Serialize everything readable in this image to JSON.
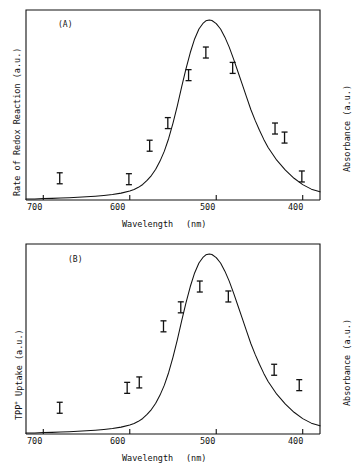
{
  "figure": {
    "background": "#ffffff",
    "line_color": "#111111",
    "panels": [
      {
        "id": "A",
        "label": "(A)",
        "y_left_title": "Rate of Redox Reaction  (a.u.)",
        "y_right_title": "Absorbance  (a.u.)",
        "x_title": "Wavelength",
        "x_units": "(nm)"
      },
      {
        "id": "B",
        "label": "(B)",
        "y_left_title_pre": "TPP",
        "y_left_title_sup": "+",
        "y_left_title_post": " Uptake  (a.u.)",
        "y_right_title": "Absorbance  (a.u.)",
        "x_title": "Wavelength",
        "x_units": "(nm)"
      }
    ],
    "x_ticks": [
      "700",
      "600",
      "500",
      "400"
    ]
  },
  "chart_data": [
    {
      "type": "line",
      "title": "(A)",
      "xlabel": "Wavelength (nm)",
      "ylabel": "Rate of Redox Reaction (a.u.)",
      "y2label": "Absorbance (a.u.)",
      "xlim": [
        720,
        380
      ],
      "ylim": [
        0,
        1.05
      ],
      "x_reversed": true,
      "grid": false,
      "legend": "none",
      "xticks": [
        700,
        600,
        500,
        400
      ],
      "series": [
        {
          "name": "Absorbance spectrum",
          "kind": "line",
          "x": [
            720,
            710,
            700,
            690,
            680,
            670,
            660,
            650,
            640,
            630,
            620,
            610,
            600,
            595,
            590,
            585,
            580,
            575,
            570,
            565,
            560,
            555,
            550,
            545,
            540,
            535,
            530,
            525,
            520,
            515,
            512,
            508,
            505,
            500,
            495,
            490,
            485,
            480,
            475,
            470,
            465,
            460,
            455,
            450,
            445,
            440,
            430,
            420,
            410,
            400,
            390,
            380
          ],
          "y": [
            0.005,
            0.006,
            0.008,
            0.009,
            0.011,
            0.013,
            0.015,
            0.018,
            0.021,
            0.025,
            0.03,
            0.038,
            0.05,
            0.058,
            0.07,
            0.086,
            0.108,
            0.135,
            0.17,
            0.215,
            0.27,
            0.34,
            0.425,
            0.52,
            0.625,
            0.725,
            0.815,
            0.89,
            0.945,
            0.978,
            0.99,
            0.995,
            0.992,
            0.975,
            0.945,
            0.9,
            0.845,
            0.78,
            0.71,
            0.64,
            0.57,
            0.5,
            0.44,
            0.385,
            0.335,
            0.29,
            0.22,
            0.165,
            0.12,
            0.085,
            0.06,
            0.045
          ]
        },
        {
          "name": "Rate of redox reaction data points",
          "kind": "ibar",
          "points": [
            {
              "x": 681,
              "y": 0.12
            },
            {
              "x": 601,
              "y": 0.115
            },
            {
              "x": 577,
              "y": 0.3
            },
            {
              "x": 556,
              "y": 0.425
            },
            {
              "x": 532,
              "y": 0.69
            },
            {
              "x": 512,
              "y": 0.815
            },
            {
              "x": 481,
              "y": 0.73
            },
            {
              "x": 432,
              "y": 0.395
            },
            {
              "x": 421,
              "y": 0.345
            },
            {
              "x": 401,
              "y": 0.13
            }
          ]
        }
      ]
    },
    {
      "type": "line",
      "title": "(B)",
      "xlabel": "Wavelength (nm)",
      "ylabel": "TPP+ Uptake (a.u.)",
      "y2label": "Absorbance (a.u.)",
      "xlim": [
        720,
        380
      ],
      "ylim": [
        0,
        1.05
      ],
      "x_reversed": true,
      "grid": false,
      "legend": "none",
      "xticks": [
        700,
        600,
        500,
        400
      ],
      "series": [
        {
          "name": "Absorbance spectrum",
          "kind": "line",
          "x": [
            720,
            710,
            700,
            690,
            680,
            670,
            660,
            650,
            640,
            630,
            620,
            610,
            600,
            595,
            590,
            585,
            580,
            575,
            570,
            565,
            560,
            555,
            550,
            545,
            540,
            535,
            530,
            525,
            520,
            515,
            512,
            508,
            505,
            500,
            495,
            490,
            485,
            480,
            475,
            470,
            465,
            460,
            455,
            450,
            445,
            440,
            430,
            420,
            410,
            400,
            390,
            380
          ],
          "y": [
            0.005,
            0.006,
            0.008,
            0.009,
            0.011,
            0.013,
            0.015,
            0.018,
            0.021,
            0.025,
            0.03,
            0.038,
            0.05,
            0.058,
            0.07,
            0.086,
            0.108,
            0.135,
            0.17,
            0.215,
            0.27,
            0.34,
            0.425,
            0.52,
            0.625,
            0.725,
            0.815,
            0.89,
            0.945,
            0.978,
            0.99,
            0.995,
            0.992,
            0.975,
            0.945,
            0.9,
            0.845,
            0.78,
            0.71,
            0.64,
            0.57,
            0.5,
            0.44,
            0.385,
            0.335,
            0.29,
            0.22,
            0.165,
            0.12,
            0.085,
            0.06,
            0.045
          ]
        },
        {
          "name": "TPP+ uptake data points",
          "kind": "ibar",
          "points": [
            {
              "x": 681,
              "y": 0.145
            },
            {
              "x": 603,
              "y": 0.255
            },
            {
              "x": 589,
              "y": 0.285
            },
            {
              "x": 561,
              "y": 0.595
            },
            {
              "x": 541,
              "y": 0.7
            },
            {
              "x": 519,
              "y": 0.815
            },
            {
              "x": 486,
              "y": 0.76
            },
            {
              "x": 433,
              "y": 0.355
            },
            {
              "x": 404,
              "y": 0.27
            }
          ]
        }
      ]
    }
  ]
}
